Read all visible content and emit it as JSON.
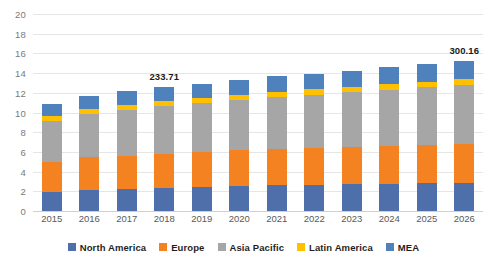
{
  "chart_data": {
    "type": "bar",
    "subtype": "stacked-column",
    "title": "",
    "xlabel": "",
    "ylabel": "",
    "ylim": [
      0,
      20
    ],
    "ytick_step": 2,
    "yticks": [
      "20",
      "18",
      "16",
      "14",
      "12",
      "10",
      "8",
      "6",
      "4",
      "2",
      "0"
    ],
    "grid": true,
    "legend_position": "bottom",
    "categories": [
      "2015",
      "2016",
      "2017",
      "2018",
      "2019",
      "2020",
      "2021",
      "2022",
      "2023",
      "2024",
      "2025",
      "2026"
    ],
    "series": [
      {
        "name": "North America",
        "color": "#4f6fab",
        "values": [
          1.95,
          2.15,
          2.25,
          2.35,
          2.4,
          2.5,
          2.6,
          2.65,
          2.7,
          2.75,
          2.8,
          2.85
        ]
      },
      {
        "name": "Europe",
        "color": "#f58220",
        "values": [
          3.05,
          3.3,
          3.3,
          3.45,
          3.55,
          3.65,
          3.7,
          3.75,
          3.8,
          3.85,
          3.9,
          3.95
        ]
      },
      {
        "name": "Asia Pacific",
        "color": "#a6a6a6",
        "values": [
          4.1,
          4.45,
          4.75,
          4.85,
          5.0,
          5.15,
          5.3,
          5.4,
          5.55,
          5.7,
          5.85,
          6.0
        ]
      },
      {
        "name": "Latin America",
        "color": "#ffc000",
        "values": [
          0.5,
          0.5,
          0.5,
          0.5,
          0.5,
          0.52,
          0.53,
          0.55,
          0.56,
          0.58,
          0.6,
          0.62
        ]
      },
      {
        "name": "MEA",
        "color": "#4f81bd",
        "values": [
          1.25,
          1.3,
          1.4,
          1.4,
          1.45,
          1.5,
          1.55,
          1.6,
          1.65,
          1.72,
          1.78,
          1.85
        ]
      }
    ],
    "annotations": [
      {
        "text": "233.71",
        "category": "2018",
        "x_index": 3
      },
      {
        "text": "300.16",
        "category": "2026",
        "x_index": 11
      }
    ]
  },
  "legend": {
    "items": [
      {
        "label": "North America",
        "color": "#4f6fab"
      },
      {
        "label": "Europe",
        "color": "#f58220"
      },
      {
        "label": "Asia Pacific",
        "color": "#a6a6a6"
      },
      {
        "label": "Latin America",
        "color": "#ffc000"
      },
      {
        "label": "MEA",
        "color": "#4f81bd"
      }
    ]
  },
  "colors": {
    "background": "#ffffff",
    "gridline": "#e6e6e6",
    "axis_text": "#7a7a7a",
    "label_text": "#1a1a1a"
  }
}
